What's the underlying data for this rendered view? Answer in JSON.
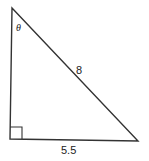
{
  "diagram": {
    "type": "right-triangle",
    "angle_label": "θ",
    "hypotenuse_label": "8",
    "base_label": "5.5",
    "right_angle_marker": true,
    "line_color": "#333333"
  }
}
